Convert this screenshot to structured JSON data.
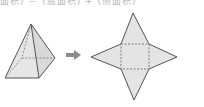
{
  "caption": "面积) ＝ (底面积) + (侧面积)",
  "figure": {
    "left_shape": "square-pyramid",
    "arrow": "right-arrow",
    "right_shape": "square-pyramid-net",
    "colors": {
      "face_fill": "#e4e4e4",
      "edge": "#555555",
      "hidden_edge": "#777777",
      "arrow": "#8a8a8a"
    }
  }
}
